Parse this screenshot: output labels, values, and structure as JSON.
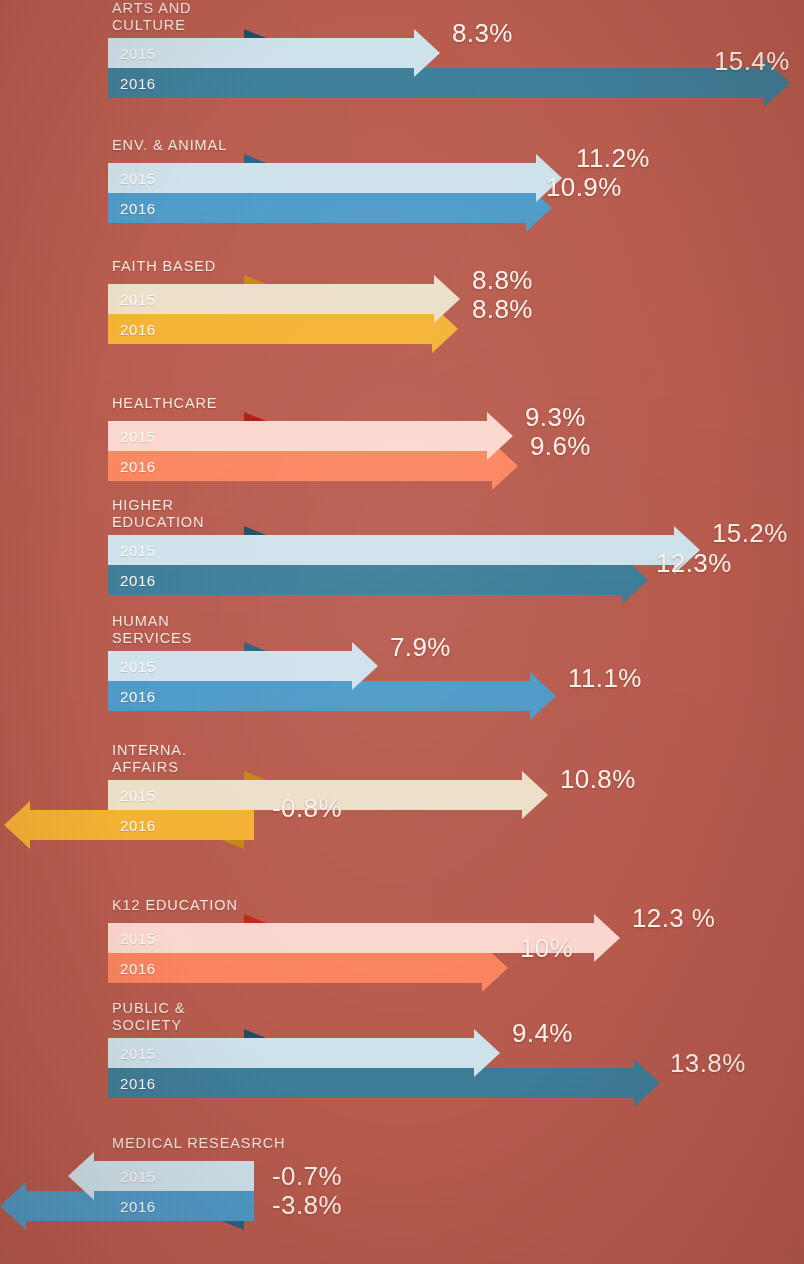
{
  "background_color": "#b85c4e",
  "legend": {
    "year_2015": "2015",
    "year_2016": "2016"
  },
  "palettes": {
    "blue": {
      "light": "#cfe3ec",
      "dark": "#3e7e99",
      "fold": "#1d4f63"
    },
    "blue2": {
      "light": "#cfe3ec",
      "dark": "#4e9bc8",
      "fold": "#2a6285"
    },
    "gold": {
      "light": "#ece0c9",
      "dark": "#f5b335",
      "fold": "#c08a14"
    },
    "coral": {
      "light": "#fbd8cf",
      "dark": "#fb8660",
      "fold": "#a81f11"
    },
    "coral2": {
      "light": "#fbd8cf",
      "dark": "#fb8660",
      "fold": "#c02a14"
    }
  },
  "chart_data": {
    "type": "bar",
    "xlabel": "",
    "ylabel": "",
    "orientation": "horizontal",
    "series": [
      {
        "name": "2015",
        "values": [
          8.3,
          11.2,
          8.8,
          9.3,
          15.2,
          7.9,
          10.8,
          12.3,
          9.4,
          -0.7
        ]
      },
      {
        "name": "2016",
        "values": [
          15.4,
          10.9,
          8.8,
          9.6,
          12.3,
          11.1,
          -0.8,
          10.0,
          13.8,
          -3.8
        ]
      }
    ],
    "categories": [
      "ARTS AND CULTURE",
      "ENV. & ANIMAL",
      "FAITH BASED",
      "HEALTHCARE",
      "HIGHER EDUCATION",
      "HUMAN SERVICES",
      "INTERNA. AFFAIRS",
      "K12 EDUCATION",
      "PUBLIC & SOCIETY",
      "MEDICAL RESEASRCH"
    ],
    "value_suffix": "%",
    "grid": false,
    "legend_position": "inline-left-plates"
  },
  "rows": [
    {
      "id": "arts-and-culture",
      "label": "ARTS AND\nCULTURE",
      "palette": "blue",
      "top": 0,
      "label_top": 0,
      "plate_top": 38,
      "v2015": {
        "text": "8.3%",
        "value": 8.3,
        "dir": "right",
        "tip": 440,
        "label_x": 452,
        "label_y": 18
      },
      "v2016": {
        "text": "15.4%",
        "value": 15.4,
        "dir": "right",
        "tip": 790,
        "label_x": 714,
        "label_y": 46
      }
    },
    {
      "id": "env-and-animal",
      "label": "ENV. & ANIMAL",
      "palette": "blue2",
      "top": 137,
      "label_top": 137,
      "plate_top": 163,
      "v2015": {
        "text": "11.2%",
        "value": 11.2,
        "dir": "right",
        "tip": 562,
        "label_x": 576,
        "label_y": 143
      },
      "v2016": {
        "text": "10.9%",
        "value": 10.9,
        "dir": "right",
        "tip": 552,
        "label_x": 546,
        "label_y": 172
      }
    },
    {
      "id": "faith-based",
      "label": "FAITH BASED",
      "palette": "gold",
      "top": 258,
      "label_top": 258,
      "plate_top": 284,
      "v2015": {
        "text": "8.8%",
        "value": 8.8,
        "dir": "right",
        "tip": 460,
        "label_x": 472,
        "label_y": 265
      },
      "v2016": {
        "text": "8.8%",
        "value": 8.8,
        "dir": "right",
        "tip": 458,
        "label_x": 472,
        "label_y": 294
      }
    },
    {
      "id": "healthcare",
      "label": "HEALTHCARE",
      "palette": "coral",
      "top": 395,
      "label_top": 395,
      "plate_top": 421,
      "v2015": {
        "text": "9.3%",
        "value": 9.3,
        "dir": "right",
        "tip": 513,
        "label_x": 525,
        "label_y": 402
      },
      "v2016": {
        "text": "9.6%",
        "value": 9.6,
        "dir": "right",
        "tip": 518,
        "label_x": 530,
        "label_y": 431
      }
    },
    {
      "id": "higher-education",
      "label": "HIGHER\nEDUCATION",
      "palette": "blue",
      "top": 497,
      "label_top": 497,
      "plate_top": 535,
      "v2015": {
        "text": "15.2%",
        "value": 15.2,
        "dir": "right",
        "tip": 700,
        "label_x": 712,
        "label_y": 518
      },
      "v2016": {
        "text": "12.3%",
        "value": 12.3,
        "dir": "right",
        "tip": 648,
        "label_x": 656,
        "label_y": 548
      }
    },
    {
      "id": "human-services",
      "label": "HUMAN\nSERVICES",
      "palette": "blue2",
      "top": 613,
      "label_top": 613,
      "plate_top": 651,
      "v2015": {
        "text": "7.9%",
        "value": 7.9,
        "dir": "right",
        "tip": 378,
        "label_x": 390,
        "label_y": 632
      },
      "v2016": {
        "text": "11.1%",
        "value": 11.1,
        "dir": "right",
        "tip": 556,
        "label_x": 568,
        "label_y": 663
      }
    },
    {
      "id": "international-affairs",
      "label": "INTERNA.\nAFFAIRS",
      "palette": "gold",
      "top": 742,
      "label_top": 742,
      "plate_top": 780,
      "v2015": {
        "text": "10.8%",
        "value": 10.8,
        "dir": "right",
        "tip": 548,
        "label_x": 560,
        "label_y": 764
      },
      "v2016": {
        "text": "-0.8%",
        "value": -0.8,
        "dir": "left",
        "tip": 4,
        "label_x": 272,
        "label_y": 793
      }
    },
    {
      "id": "k12-education",
      "label": "K12 EDUCATION",
      "palette": "coral2",
      "top": 897,
      "label_top": 897,
      "plate_top": 923,
      "v2015": {
        "text": "12.3 %",
        "value": 12.3,
        "dir": "right",
        "tip": 620,
        "label_x": 632,
        "label_y": 903
      },
      "v2016": {
        "text": "10%",
        "value": 10.0,
        "dir": "right",
        "tip": 508,
        "label_x": 520,
        "label_y": 933
      }
    },
    {
      "id": "public-and-society",
      "label": "PUBLIC &\nSOCIETY",
      "palette": "blue",
      "top": 1000,
      "label_top": 1000,
      "plate_top": 1038,
      "v2015": {
        "text": "9.4%",
        "value": 9.4,
        "dir": "right",
        "tip": 500,
        "label_x": 512,
        "label_y": 1018
      },
      "v2016": {
        "text": "13.8%",
        "value": 13.8,
        "dir": "right",
        "tip": 660,
        "label_x": 670,
        "label_y": 1048
      }
    },
    {
      "id": "medical-research",
      "label": "MEDICAL RESEASRCH",
      "palette": "blue2",
      "top": 1135,
      "label_top": 1135,
      "plate_top": 1161,
      "v2015": {
        "text": "-0.7%",
        "value": -0.7,
        "dir": "left",
        "tip": 68,
        "label_x": 272,
        "label_y": 1161
      },
      "v2016": {
        "text": "-3.8%",
        "value": -3.8,
        "dir": "left",
        "tip": 0,
        "label_x": 272,
        "label_y": 1190
      }
    }
  ]
}
